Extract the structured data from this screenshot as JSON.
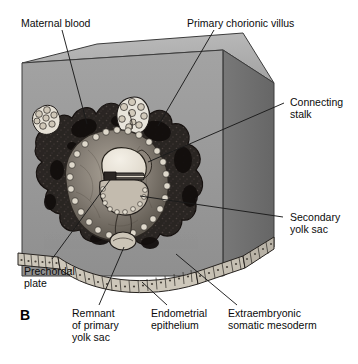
{
  "figure": {
    "panel_letter": "B",
    "caption_labels": {
      "maternal_blood": "Maternal blood",
      "primary_chorionic_villus": "Primary chorionic villus",
      "connecting_stalk_l1": "Connecting",
      "connecting_stalk_l2": "stalk",
      "secondary_yolk_sac_l1": "Secondary",
      "secondary_yolk_sac_l2": "yolk sac",
      "prechordal_plate_l1": "Prechordal",
      "prechordal_plate_l2": "plate",
      "remnant_l1": "Remnant",
      "remnant_l2": "of primary",
      "remnant_l3": "yolk sac",
      "endometrial_epithelium_l1": "Endometrial",
      "endometrial_epithelium_l2": "epithelium",
      "extraembryonic_l1": "Extraembryonic",
      "extraembryonic_l2": "somatic mesoderm"
    }
  },
  "colors": {
    "background": "#ffffff",
    "text": "#0b0b0b",
    "leader_line": "#1a1a1a",
    "block_top_face": "#b2b2b2",
    "block_front_face": "#9a9a9a",
    "block_right_face": "#6f6f6f",
    "block_edge": "#3a3a3a",
    "decidua_dark": "#241f1e",
    "decidua_mid": "#3d3634",
    "trophoblast_light": "#d8d2c8",
    "villus_pale": "#e8e4db",
    "chorionic_cavity": "#8b847c",
    "amniotic_cavity": "#efeae0",
    "yolk_sac": "#b5ada2",
    "embryonic_disc": "#55504b",
    "epithelium_cell": "#cfc9bd",
    "epithelium_outline": "#2a2724"
  },
  "structures": [
    {
      "name": "endometrial-block",
      "description": "3D cut block of endometrium"
    },
    {
      "name": "implanted-conceptus",
      "description": "dark implantation site within endometrium"
    },
    {
      "name": "primary-chorionic-villi",
      "description": "pale finger-like projections at top of conceptus"
    },
    {
      "name": "maternal-blood-lacunae",
      "description": "dark blood-filled lacunar spaces"
    },
    {
      "name": "amniotic-cavity",
      "description": "pale cavity above embryonic disc"
    },
    {
      "name": "secondary-yolk-sac",
      "description": "rounded sac below embryonic disc"
    },
    {
      "name": "remnant-primary-yolk-sac",
      "description": "small vesicle at base of chorionic cavity"
    },
    {
      "name": "connecting-stalk",
      "description": "stalk joining embryo to chorion"
    },
    {
      "name": "prechordal-plate",
      "description": "thickened region of embryonic disc"
    },
    {
      "name": "extraembryonic-somatic-mesoderm",
      "description": "lining of chorionic cavity"
    },
    {
      "name": "endometrial-epithelium",
      "description": "cuboidal cell layer along lower surface"
    }
  ]
}
